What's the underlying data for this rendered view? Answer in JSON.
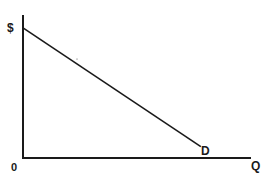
{
  "chart_data": {
    "type": "line",
    "title": "",
    "xlabel": "Q",
    "ylabel": "$",
    "origin_label": "0",
    "grid": false,
    "legend": null,
    "xlim": [
      0,
      100
    ],
    "ylim": [
      0,
      100
    ],
    "series": [
      {
        "name": "D",
        "x": [
          0,
          78
        ],
        "y": [
          91,
          8
        ]
      }
    ],
    "annotations": [
      {
        "text": "D",
        "x": 80,
        "y": 6
      }
    ]
  },
  "labels": {
    "y_axis": "$",
    "x_axis": "Q",
    "origin": "0",
    "curve": "D"
  },
  "colors": {
    "ink": "#1a1a1a",
    "background": "#ffffff"
  }
}
